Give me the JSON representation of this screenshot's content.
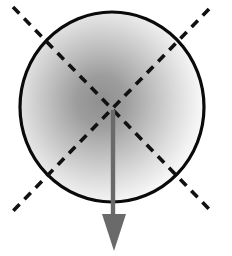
{
  "figure": {
    "canvas": {
      "width": 232,
      "height": 256,
      "background_color": "#ffffff"
    },
    "circle": {
      "name": "outline-circle",
      "center_x": 112,
      "center_y": 107,
      "radius_x": 92,
      "radius_y": 95,
      "stroke_color": "#0a0a0a",
      "stroke_width": 3.2,
      "fill": "none"
    },
    "shading": {
      "name": "radial-gray-gradient",
      "type": "radial",
      "center_x": 101,
      "center_y": 101,
      "radius": 96,
      "inner_color": "#8f8f8f",
      "mid_color": "#bdbdbd",
      "outer_color": "#ffffff",
      "description": "soft gray glow strongest near center fading to white at the rim"
    },
    "dashed_lines": [
      {
        "name": "dashed-diagonal-nwse",
        "x1": 13,
        "y1": 7,
        "x2": 211,
        "y2": 211,
        "stroke_color": "#111111",
        "stroke_width": 3.6,
        "dash_length": 9,
        "gap_length": 7
      },
      {
        "name": "dashed-diagonal-nesw",
        "x1": 209,
        "y1": 9,
        "x2": 13,
        "y2": 211,
        "stroke_color": "#111111",
        "stroke_width": 3.6,
        "dash_length": 9,
        "gap_length": 7
      }
    ],
    "crossing_point": {
      "name": "diagonal-intersection",
      "x": 112,
      "y": 110
    },
    "arrow": {
      "name": "downward-arrow",
      "color": "#6a6a6a",
      "shaft": {
        "x": 113,
        "y_start": 110,
        "y_end": 218,
        "width": 4.4
      },
      "head": {
        "tip_x": 114,
        "tip_y": 251,
        "left_x": 102,
        "right_x": 126,
        "base_y": 214
      },
      "direction": "down"
    }
  }
}
